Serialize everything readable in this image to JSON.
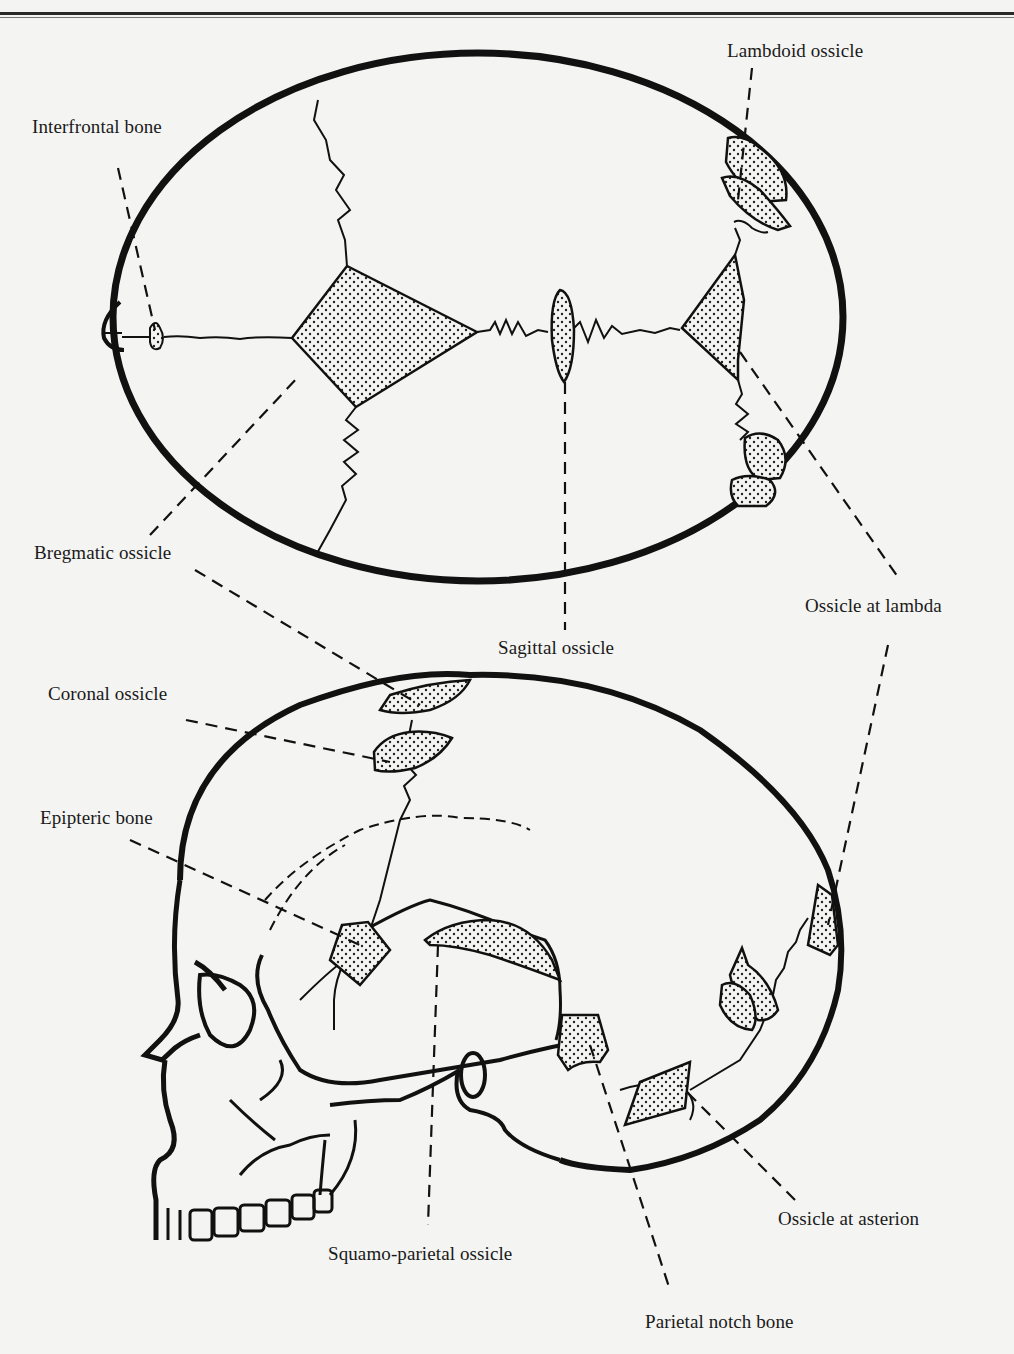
{
  "figure": {
    "background": "#f4f4f2",
    "ink_color": "#111111",
    "stipple_color": "#222222",
    "views": {
      "superior": "Superior (vertex) view of skull",
      "lateral": "Left lateral view of skull"
    }
  },
  "labels": {
    "lambdoid_ossicle": "Lambdoid ossicle",
    "interfrontal_bone": "Interfrontal bone",
    "bregmatic_ossicle": "Bregmatic ossicle",
    "ossicle_at_lambda": "Ossicle at lambda",
    "sagittal_ossicle": "Sagittal ossicle",
    "coronal_ossicle": "Coronal ossicle",
    "epipteric_bone": "Epipteric bone",
    "ossicle_at_asterion": "Ossicle at asterion",
    "squamo_parietal_ossicle": "Squamo-parietal ossicle",
    "parietal_notch_bone": "Parietal notch bone"
  }
}
